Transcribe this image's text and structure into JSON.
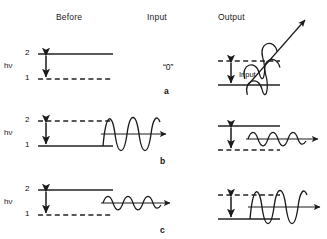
{
  "figure": {
    "columns": [
      {
        "id": "before",
        "label": "Before",
        "x": 78,
        "y": 18
      },
      {
        "id": "input",
        "label": "Input",
        "x": 163,
        "y": 18
      },
      {
        "id": "output",
        "label": "Output",
        "x": 236,
        "y": 18
      }
    ],
    "colors": {
      "ink": "#1a1a1a",
      "line": "#222222",
      "background": "#ffffff"
    },
    "rows": [
      {
        "id": "a",
        "label": "a",
        "label_x": 163,
        "label_y": 92,
        "process": "spontaneous emission",
        "level_labels": {
          "upper": "2",
          "lower": "1"
        },
        "hv_label": "hν",
        "before": {
          "upper_style": "solid",
          "lower_style": "dashed",
          "populated": "upper"
        },
        "input": {
          "type": "none",
          "text": "“0”"
        },
        "output": {
          "upper_style": "dashed",
          "lower_style": "solid",
          "populated": "lower",
          "wave": "helix-diagonal",
          "amplitude": "large",
          "arrow_label": "Input"
        }
      },
      {
        "id": "b",
        "label": "b",
        "label_x": 160,
        "label_y": 162,
        "process": "absorption",
        "level_labels": {
          "upper": "2",
          "lower": "1"
        },
        "hv_label": "hν",
        "before": {
          "upper_style": "dashed",
          "lower_style": "solid",
          "populated": "lower"
        },
        "input": {
          "type": "wave",
          "amplitude": "large",
          "cycles": 3.5,
          "text": ""
        },
        "output": {
          "upper_style": "solid",
          "lower_style": "dashed",
          "populated": "upper",
          "wave": "sine-horizontal",
          "amplitude": "small",
          "arrow_label": ""
        }
      },
      {
        "id": "c",
        "label": "c",
        "label_x": 160,
        "label_y": 231,
        "process": "stimulated emission",
        "level_labels": {
          "upper": "2",
          "lower": "1"
        },
        "hv_label": "hν",
        "before": {
          "upper_style": "solid",
          "lower_style": "dashed",
          "populated": "upper"
        },
        "input": {
          "type": "wave",
          "amplitude": "small",
          "cycles": 3.5,
          "text": ""
        },
        "output": {
          "upper_style": "dashed",
          "lower_style": "solid",
          "populated": "lower",
          "wave": "sine-horizontal",
          "amplitude": "large",
          "arrow_label": ""
        }
      }
    ]
  }
}
